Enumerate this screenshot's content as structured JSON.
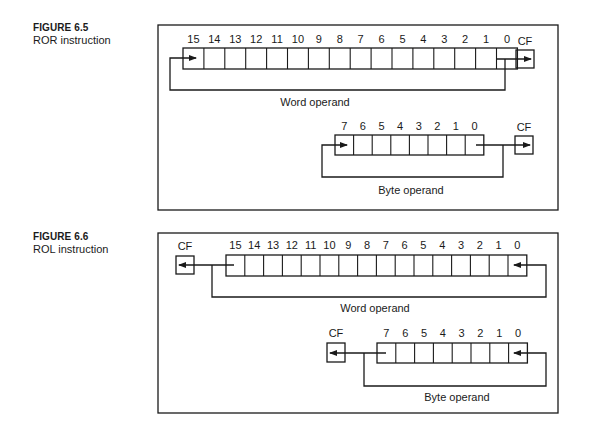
{
  "figures": [
    {
      "number_label": "FIGURE 6.5",
      "title": "ROR instruction",
      "word_bits": [
        "15",
        "14",
        "13",
        "12",
        "11",
        "10",
        "9",
        "8",
        "7",
        "6",
        "5",
        "4",
        "3",
        "2",
        "1",
        "0"
      ],
      "word_label": "Word operand",
      "byte_bits": [
        "7",
        "6",
        "5",
        "4",
        "3",
        "2",
        "1",
        "0"
      ],
      "byte_label": "Byte operand",
      "carry_label": "CF",
      "direction": "right"
    },
    {
      "number_label": "FIGURE 6.6",
      "title": "ROL instruction",
      "word_bits": [
        "15",
        "14",
        "13",
        "12",
        "11",
        "10",
        "9",
        "8",
        "7",
        "6",
        "5",
        "4",
        "3",
        "2",
        "1",
        "0"
      ],
      "word_label": "Word operand",
      "byte_bits": [
        "7",
        "6",
        "5",
        "4",
        "3",
        "2",
        "1",
        "0"
      ],
      "byte_label": "Byte operand",
      "carry_label": "CF",
      "direction": "left"
    }
  ],
  "colors": {
    "ink": "#1a1a1a",
    "background": "#ffffff"
  }
}
